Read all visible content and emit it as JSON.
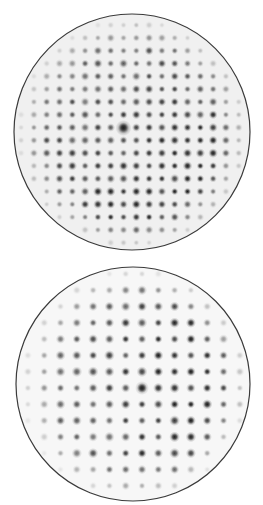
{
  "canvas": {
    "width": 263,
    "height": 505,
    "background": "#ffffff"
  },
  "patterns": [
    {
      "name": "pattern-top",
      "circle": {
        "cx": 132,
        "cy": 132,
        "r": 118,
        "stroke": "#3a3a3a"
      },
      "grid": {
        "origin_x": 123.5,
        "origin_y": 127.5,
        "spacing": 12.8,
        "rotation_deg": 0
      },
      "spot": {
        "radius": 4.3,
        "core": "#1a1a1a",
        "max_opacity": 0.95
      },
      "intensity_bias": {
        "dx": 0.15,
        "dy": 0.25
      },
      "edge_fade": {
        "start": 0.72,
        "end": 1.0
      },
      "center_blob": {
        "x": 123.5,
        "y": 128,
        "r": 8,
        "opacity": 0.85
      },
      "background_haze": 0.06
    },
    {
      "name": "pattern-bottom",
      "circle": {
        "cx": 133,
        "cy": 384,
        "r": 117,
        "stroke": "#3a3a3a"
      },
      "grid": {
        "origin_x": 142,
        "origin_y": 388,
        "spacing": 16.3,
        "rotation_deg": 0
      },
      "spot": {
        "radius": 4.8,
        "core": "#151515",
        "max_opacity": 0.95
      },
      "intensity_bias": {
        "dx": 0.35,
        "dy": 0.0
      },
      "edge_fade": {
        "start": 0.7,
        "end": 1.0
      },
      "center_blob": {
        "x": 142,
        "y": 388,
        "r": 7,
        "opacity": 0.7
      },
      "background_haze": 0.03
    }
  ]
}
